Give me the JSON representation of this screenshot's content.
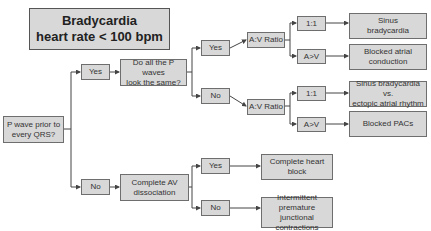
{
  "title": {
    "line1": "Bradycardia",
    "line2": "heart rate < 100 bpm"
  },
  "nodes": {
    "root": "P wave prior to\nevery QRS?",
    "yes1": "Yes",
    "no1": "No",
    "p_same": "Do all the P waves\nlook the same?",
    "yes2": "Yes",
    "no2": "No",
    "av_ratio_a": "A:V Ratio",
    "av_ratio_b": "A:V Ratio",
    "ratio_11_a": "1:1",
    "ratio_av_a": "A>V",
    "ratio_11_b": "1:1",
    "ratio_av_b": "A>V",
    "complete_av": "Complete AV\ndissociation",
    "yes3": "Yes",
    "no3": "No"
  },
  "outcomes": {
    "sinus_brady": "Sinus\nbradycardia",
    "blocked_atrial": "Blocked atrial\nconduction",
    "sinus_vs_ectopic": "Sinus bradycardia vs.\nectopic atrial rhythm",
    "blocked_pacs": "Blocked PACs",
    "complete_heart_block": "Complete heart\nblock",
    "intermittent_pjc": "Intermittent\npremature junctional\ncontractions"
  },
  "colors": {
    "box_fill": "#d8d8d8",
    "border": "#6e6e6e",
    "line": "#444444"
  }
}
